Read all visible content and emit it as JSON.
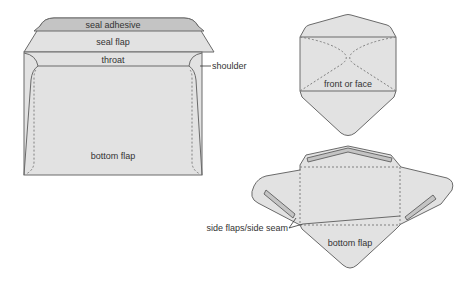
{
  "diagram": {
    "type": "envelope-anatomy",
    "colors": {
      "paper_fill": "#e2e2e2",
      "adhesive_fill": "#c4c4c4",
      "outline": "#6a6a6a",
      "dashed_fold": "#808080",
      "label_text": "#333333",
      "background": "#ffffff"
    },
    "left_envelope": {
      "description": "Back view of envelope with open seal flap",
      "labels": {
        "seal_adhesive": "seal adhesive",
        "seal_flap": "seal flap",
        "throat": "throat",
        "shoulder": "shoulder",
        "bottom_flap": "bottom flap"
      }
    },
    "top_right_envelope": {
      "description": "Front view with folded flaps shown dashed",
      "labels": {
        "front": "front or face"
      }
    },
    "bottom_right_envelope": {
      "description": "Unfolded envelope blank with adhesive strips",
      "labels": {
        "side_flaps": "side flaps/side seam",
        "bottom_flap": "bottom flap"
      }
    }
  }
}
